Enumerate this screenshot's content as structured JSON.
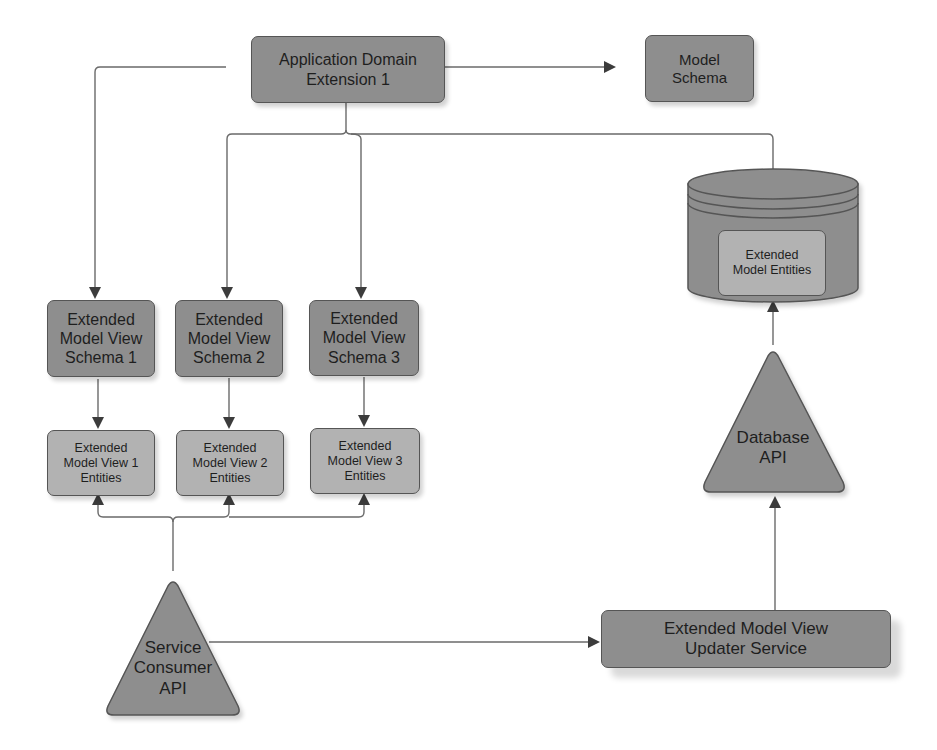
{
  "diagram": {
    "colors": {
      "node_dark": "#8e8e8e",
      "node_light": "#b2b2b2",
      "stroke": "#555555",
      "connector": "#6a6a6a",
      "background": "#ffffff"
    },
    "nodes": {
      "app_domain": {
        "label": "Application Domain\nExtension 1",
        "shape": "rounded-rect"
      },
      "model_schema": {
        "label": "Model\nSchema",
        "shape": "rounded-rect"
      },
      "database": {
        "label": "Extended\nModel Entities",
        "shape": "cylinder"
      },
      "view_schemas": [
        {
          "label": "Extended\nModel View\nSchema 1",
          "shape": "rounded-rect"
        },
        {
          "label": "Extended\nModel View\nSchema 2",
          "shape": "rounded-rect"
        },
        {
          "label": "Extended\nModel View\nSchema 3",
          "shape": "rounded-rect"
        }
      ],
      "view_entities": [
        {
          "label": "Extended\nModel View 1\nEntities",
          "shape": "rounded-rect"
        },
        {
          "label": "Extended\nModel View 2\nEntities",
          "shape": "rounded-rect"
        },
        {
          "label": "Extended\nModel View 3\nEntities",
          "shape": "rounded-rect"
        }
      ],
      "database_api": {
        "label": "Database\nAPI",
        "shape": "triangle"
      },
      "service_consumer_api": {
        "label": "Service\nConsumer\nAPI",
        "shape": "triangle"
      },
      "updater_service": {
        "label": "Extended Model View\nUpdater Service",
        "shape": "rounded-rect"
      }
    },
    "edges": [
      {
        "from": "Application Domain Extension 1",
        "to": "Model Schema"
      },
      {
        "from": "Application Domain Extension 1",
        "to": "Extended Model View Schema 1"
      },
      {
        "from": "Application Domain Extension 1",
        "to": "Extended Model View Schema 2"
      },
      {
        "from": "Application Domain Extension 1",
        "to": "Extended Model View Schema 3"
      },
      {
        "from": "Application Domain Extension 1",
        "to": "Extended Model Entities"
      },
      {
        "from": "Extended Model View Schema 1",
        "to": "Extended Model View 1 Entities"
      },
      {
        "from": "Extended Model View Schema 2",
        "to": "Extended Model View 2 Entities"
      },
      {
        "from": "Extended Model View Schema 3",
        "to": "Extended Model View 3 Entities"
      },
      {
        "from": "Service Consumer API",
        "to": "Extended Model View 1 Entities"
      },
      {
        "from": "Service Consumer API",
        "to": "Extended Model View 2 Entities"
      },
      {
        "from": "Service Consumer API",
        "to": "Extended Model View 3 Entities"
      },
      {
        "from": "Service Consumer API",
        "to": "Extended Model View Updater Service"
      },
      {
        "from": "Extended Model View Updater Service",
        "to": "Database API"
      },
      {
        "from": "Database API",
        "to": "Extended Model Entities"
      }
    ]
  }
}
